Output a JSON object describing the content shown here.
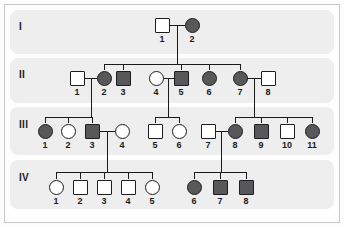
{
  "figure": {
    "type": "pedigree-chart",
    "title": "",
    "legend": {
      "affected_fill": "#58585a",
      "unaffected_fill": "#ffffff",
      "male_shape": "square",
      "female_shape": "circle"
    },
    "band_color": "#eeeeee",
    "line_color": "#1a1a1a"
  },
  "generations": [
    {
      "id": "gen-1",
      "label": "I",
      "band": {
        "x": 10,
        "y": 10,
        "w": 324,
        "h": 44
      },
      "label_pos": {
        "x": 19,
        "y": 22
      },
      "individuals": [
        {
          "id": "I-1",
          "label": "1",
          "sex": "male",
          "affected": false,
          "cx": 162,
          "cy": 25
        },
        {
          "id": "I-2",
          "label": "2",
          "sex": "female",
          "affected": true,
          "cx": 192,
          "cy": 25
        }
      ]
    },
    {
      "id": "gen-2",
      "label": "II",
      "band": {
        "x": 10,
        "y": 58,
        "w": 324,
        "h": 45
      },
      "label_pos": {
        "x": 19,
        "y": 70
      },
      "individuals": [
        {
          "id": "II-1",
          "label": "1",
          "sex": "male",
          "affected": false,
          "cx": 77,
          "cy": 78
        },
        {
          "id": "II-2",
          "label": "2",
          "sex": "female",
          "affected": true,
          "cx": 104,
          "cy": 78
        },
        {
          "id": "II-3",
          "label": "3",
          "sex": "male",
          "affected": true,
          "cx": 123,
          "cy": 78
        },
        {
          "id": "II-4",
          "label": "4",
          "sex": "female",
          "affected": false,
          "cx": 156,
          "cy": 78
        },
        {
          "id": "II-5",
          "label": "5",
          "sex": "male",
          "affected": true,
          "cx": 181,
          "cy": 78
        },
        {
          "id": "II-6",
          "label": "6",
          "sex": "female",
          "affected": true,
          "cx": 209,
          "cy": 78
        },
        {
          "id": "II-7",
          "label": "7",
          "sex": "female",
          "affected": true,
          "cx": 240,
          "cy": 78
        },
        {
          "id": "II-8",
          "label": "8",
          "sex": "male",
          "affected": false,
          "cx": 268,
          "cy": 78
        }
      ]
    },
    {
      "id": "gen-3",
      "label": "III",
      "band": {
        "x": 10,
        "y": 107,
        "w": 324,
        "h": 48
      },
      "label_pos": {
        "x": 19,
        "y": 120
      },
      "individuals": [
        {
          "id": "III-1",
          "label": "1",
          "sex": "female",
          "affected": true,
          "cx": 45,
          "cy": 131
        },
        {
          "id": "III-2",
          "label": "2",
          "sex": "female",
          "affected": false,
          "cx": 68,
          "cy": 131
        },
        {
          "id": "III-3",
          "label": "3",
          "sex": "male",
          "affected": true,
          "cx": 92,
          "cy": 131
        },
        {
          "id": "III-4",
          "label": "4",
          "sex": "female",
          "affected": false,
          "cx": 122,
          "cy": 131
        },
        {
          "id": "III-5",
          "label": "5",
          "sex": "male",
          "affected": false,
          "cx": 155,
          "cy": 131
        },
        {
          "id": "III-6",
          "label": "6",
          "sex": "female",
          "affected": false,
          "cx": 179,
          "cy": 131
        },
        {
          "id": "III-7",
          "label": "7",
          "sex": "male",
          "affected": false,
          "cx": 208,
          "cy": 131
        },
        {
          "id": "III-8",
          "label": "8",
          "sex": "female",
          "affected": true,
          "cx": 235,
          "cy": 131
        },
        {
          "id": "III-9",
          "label": "9",
          "sex": "male",
          "affected": true,
          "cx": 261,
          "cy": 131
        },
        {
          "id": "III-10",
          "label": "10",
          "sex": "male",
          "affected": false,
          "cx": 287,
          "cy": 131
        },
        {
          "id": "III-11",
          "label": "11",
          "sex": "female",
          "affected": true,
          "cx": 312,
          "cy": 131
        }
      ]
    },
    {
      "id": "gen-4",
      "label": "IV",
      "band": {
        "x": 10,
        "y": 160,
        "w": 324,
        "h": 49
      },
      "label_pos": {
        "x": 19,
        "y": 173
      },
      "individuals": [
        {
          "id": "IV-1",
          "label": "1",
          "sex": "female",
          "affected": false,
          "cx": 56,
          "cy": 187
        },
        {
          "id": "IV-2",
          "label": "2",
          "sex": "male",
          "affected": false,
          "cx": 80,
          "cy": 187
        },
        {
          "id": "IV-3",
          "label": "3",
          "sex": "male",
          "affected": false,
          "cx": 104,
          "cy": 187
        },
        {
          "id": "IV-4",
          "label": "4",
          "sex": "male",
          "affected": false,
          "cx": 128,
          "cy": 187
        },
        {
          "id": "IV-5",
          "label": "5",
          "sex": "female",
          "affected": false,
          "cx": 152,
          "cy": 187
        },
        {
          "id": "IV-6",
          "label": "6",
          "sex": "female",
          "affected": true,
          "cx": 194,
          "cy": 187
        },
        {
          "id": "IV-7",
          "label": "7",
          "sex": "male",
          "affected": true,
          "cx": 220,
          "cy": 187
        },
        {
          "id": "IV-8",
          "label": "8",
          "sex": "male",
          "affected": true,
          "cx": 246,
          "cy": 187
        }
      ]
    }
  ],
  "matings": [
    {
      "id": "mating-I1-I2",
      "partners": [
        "I-1",
        "I-2"
      ],
      "children": [
        "II-2",
        "II-3",
        "II-5",
        "II-6",
        "II-7"
      ]
    },
    {
      "id": "mating-II1-II2",
      "partners": [
        "II-1",
        "II-2"
      ],
      "children": [
        "III-1",
        "III-2",
        "III-3"
      ]
    },
    {
      "id": "mating-II4-II5",
      "partners": [
        "II-4",
        "II-5"
      ],
      "children": [
        "III-5",
        "III-6"
      ]
    },
    {
      "id": "mating-II7-II8",
      "partners": [
        "II-7",
        "II-8"
      ],
      "children": [
        "III-8",
        "III-9",
        "III-10",
        "III-11"
      ]
    },
    {
      "id": "mating-III3-III4",
      "partners": [
        "III-3",
        "III-4"
      ],
      "children": [
        "IV-1",
        "IV-2",
        "IV-3",
        "IV-4",
        "IV-5"
      ]
    },
    {
      "id": "mating-III7-III8",
      "partners": [
        "III-7",
        "III-8"
      ],
      "children": [
        "IV-6",
        "IV-7",
        "IV-8"
      ]
    }
  ],
  "connectors": {
    "mating_lines": [
      {
        "id": "ml-I1-I2",
        "x1": 170,
        "x2": 185,
        "y": 25
      },
      {
        "id": "ml-II1-II2",
        "x1": 85,
        "x2": 97,
        "y": 78
      },
      {
        "id": "ml-II4-II5",
        "x1": 163,
        "x2": 174,
        "y": 78
      },
      {
        "id": "ml-II7-II8",
        "x1": 247,
        "x2": 261,
        "y": 78
      },
      {
        "id": "ml-III3-III4",
        "x1": 99,
        "x2": 115,
        "y": 131
      },
      {
        "id": "ml-III7-III8",
        "x1": 215,
        "x2": 228,
        "y": 131
      }
    ],
    "descent_drops": [
      {
        "id": "drop-I",
        "x": 177,
        "y1": 25,
        "y2": 64
      },
      {
        "id": "drop-II1",
        "x": 91,
        "y1": 78,
        "y2": 117
      },
      {
        "id": "drop-II4",
        "x": 168,
        "y1": 78,
        "y2": 117
      },
      {
        "id": "drop-II7",
        "x": 254,
        "y1": 78,
        "y2": 117
      },
      {
        "id": "drop-III3",
        "x": 107,
        "y1": 131,
        "y2": 172
      },
      {
        "id": "drop-III7",
        "x": 221,
        "y1": 131,
        "y2": 172
      }
    ],
    "sibship_bars": [
      {
        "id": "sib-I",
        "x1": 104,
        "x2": 240,
        "y": 64,
        "stems": [
          104,
          123,
          181,
          209,
          240
        ],
        "stem_to": 70
      },
      {
        "id": "sib-II1",
        "x1": 45,
        "x2": 92,
        "y": 117,
        "stems": [
          45,
          68,
          92
        ],
        "stem_to": 123
      },
      {
        "id": "sib-II4",
        "x1": 155,
        "x2": 179,
        "y": 117,
        "stems": [
          155,
          179
        ],
        "stem_to": 123
      },
      {
        "id": "sib-II7",
        "x1": 235,
        "x2": 312,
        "y": 117,
        "stems": [
          235,
          261,
          287,
          312
        ],
        "stem_to": 123
      },
      {
        "id": "sib-III3",
        "x1": 56,
        "x2": 152,
        "y": 172,
        "stems": [
          56,
          80,
          104,
          128,
          152
        ],
        "stem_to": 179
      },
      {
        "id": "sib-III7",
        "x1": 194,
        "x2": 246,
        "y": 172,
        "stems": [
          194,
          220,
          246
        ],
        "stem_to": 179
      }
    ]
  },
  "symbol_size": {
    "square": 15,
    "circle": 15
  }
}
